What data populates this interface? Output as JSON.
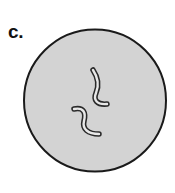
{
  "figure": {
    "panel_label": "c.",
    "background_color": "#ffffff"
  },
  "field_of_view": {
    "name": "microscope-field",
    "shape": "circle",
    "center_x": 95,
    "center_y": 100.5,
    "radius": 71,
    "fill_color": "#d3d3d3",
    "outline_color": "#1a1a1a",
    "outline_width": 2
  },
  "chart_data": {
    "type": "diagram",
    "title": "c.",
    "field_shape": "circle",
    "cell_count": 2,
    "cell_morphology": "curved rod / spiral (S-shaped)",
    "cells": [
      {
        "id": "bacterium-upper",
        "label": "",
        "path": "M 93 70 C 99 79, 99 86, 96 93 C 93 100, 97 105, 107 104",
        "stroke_color": "#2a2a2a",
        "stroke_width": 5.5,
        "fill_color": "#e8e8e8",
        "inner_stroke_color": "#e8e8e8",
        "inner_stroke_width": 2.4
      },
      {
        "id": "bacterium-lower",
        "label": "",
        "path": "M 74 109 C 84 107, 86 113, 84 121 C 82 129, 88 134, 99 134",
        "stroke_color": "#2a2a2a",
        "stroke_width": 5.5,
        "fill_color": "#e8e8e8",
        "inner_stroke_color": "#e8e8e8",
        "inner_stroke_width": 2.4
      }
    ],
    "colors": {
      "field_fill": "#d3d3d3",
      "field_outline": "#1a1a1a",
      "cell_outline": "#2a2a2a",
      "cell_fill": "#e8e8e8",
      "label_color": "#111111",
      "background": "#ffffff"
    }
  }
}
